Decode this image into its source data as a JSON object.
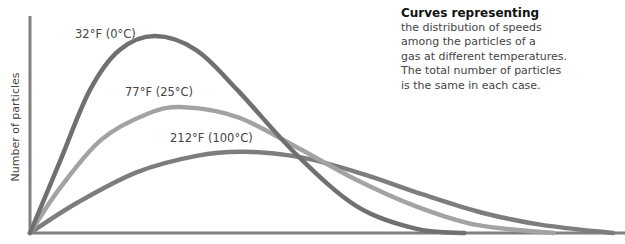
{
  "chart_data": {
    "type": "line",
    "title": "Curves representing",
    "description": "the distribution of speeds among the particles of a gas at different temperatures. The total number of particles is the same in each case.",
    "xlabel": "",
    "ylabel": "Number of particles",
    "grid": false,
    "legend": "inline labels",
    "x_units": "relative speed (0-1)",
    "series": [
      {
        "name": "32°F (0°C)",
        "color": "#777777",
        "peak_x": 0.21,
        "peak_y": 0.97,
        "end_x": 0.73,
        "points": [
          [
            0,
            0
          ],
          [
            0.05,
            0.35
          ],
          [
            0.1,
            0.7
          ],
          [
            0.15,
            0.9
          ],
          [
            0.21,
            0.97
          ],
          [
            0.28,
            0.9
          ],
          [
            0.35,
            0.7
          ],
          [
            0.45,
            0.38
          ],
          [
            0.55,
            0.13
          ],
          [
            0.65,
            0.02
          ],
          [
            0.73,
            0
          ]
        ]
      },
      {
        "name": "77°F (25°C)",
        "color": "#a0a0a0",
        "peak_x": 0.26,
        "peak_y": 0.62,
        "end_x": 0.88,
        "points": [
          [
            0,
            0
          ],
          [
            0.05,
            0.22
          ],
          [
            0.12,
            0.46
          ],
          [
            0.2,
            0.59
          ],
          [
            0.26,
            0.62
          ],
          [
            0.35,
            0.57
          ],
          [
            0.45,
            0.42
          ],
          [
            0.55,
            0.26
          ],
          [
            0.65,
            0.13
          ],
          [
            0.75,
            0.04
          ],
          [
            0.88,
            0
          ]
        ]
      },
      {
        "name": "212°F (100°C)",
        "color": "#7d7d7d",
        "peak_x": 0.36,
        "peak_y": 0.4,
        "end_x": 0.98,
        "points": [
          [
            0,
            0
          ],
          [
            0.08,
            0.15
          ],
          [
            0.18,
            0.3
          ],
          [
            0.28,
            0.38
          ],
          [
            0.36,
            0.4
          ],
          [
            0.46,
            0.37
          ],
          [
            0.56,
            0.29
          ],
          [
            0.66,
            0.19
          ],
          [
            0.76,
            0.1
          ],
          [
            0.86,
            0.04
          ],
          [
            0.98,
            0
          ]
        ]
      }
    ]
  },
  "labels": {
    "t0": "32°F (0°C)",
    "t25": "77°F (25°C)",
    "t100": "212°F (100°C)"
  },
  "axis": {
    "ylabel": "Number of particles"
  },
  "caption": {
    "title": "Curves representing",
    "line1": "the distribution of speeds",
    "line2": "among the particles of a",
    "line3": "gas at different temperatures.",
    "line4": "The total number of particles",
    "line5": "is the same in each case."
  }
}
